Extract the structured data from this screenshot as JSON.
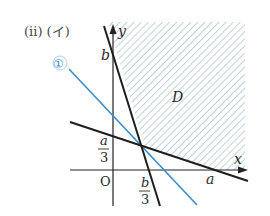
{
  "header": {
    "label": "(ii) (イ)"
  },
  "axes": {
    "x_label": "x",
    "y_label": "y",
    "origin_label": "O"
  },
  "labels": {
    "b": "b",
    "a": "a",
    "a_over_3_num": "a",
    "a_over_3_den": "3",
    "b_over_3_num": "b",
    "b_over_3_den": "3",
    "region": "D",
    "line1_marker": "①"
  },
  "colors": {
    "axis": "#222222",
    "black_line": "#1e1e1e",
    "blue_line": "#3a8cc8",
    "hatch": "#9fb6c8"
  },
  "lines": [
    {
      "name": "steep-line",
      "desc": "through (0,b) and (b/3 region)",
      "color": "#1e1e1e"
    },
    {
      "name": "shallow-line",
      "desc": "through (0,a/3) and (a,0)",
      "color": "#1e1e1e"
    },
    {
      "name": "line-1",
      "desc": "blue line labeled ①",
      "color": "#3a8cc8"
    }
  ]
}
